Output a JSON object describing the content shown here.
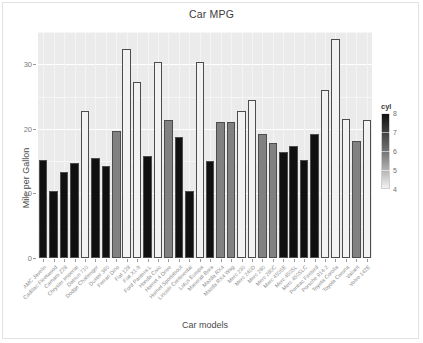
{
  "figure": {
    "title": "Car MPG",
    "legend_title": "cyl"
  },
  "axes": {
    "xlabel": "Car models",
    "ylabel": "Mile per Gallon",
    "y_ticks": [
      "0",
      "10",
      "20",
      "30"
    ],
    "legend_keys": [
      "8",
      "7",
      "6",
      "5",
      "4"
    ]
  },
  "chart_data": {
    "type": "bar",
    "title": "Car MPG",
    "xlabel": "Car models",
    "ylabel": "Mile per Gallon",
    "ylim": [
      0,
      35
    ],
    "ytick_values": [
      0,
      10,
      20,
      30
    ],
    "grid": true,
    "legend": {
      "title": "cyl",
      "position": "right",
      "type": "continuous-colorbar",
      "ticks": [
        8,
        7,
        6,
        5,
        4
      ],
      "low_color": "#f2f2f2",
      "high_color": "#111111"
    },
    "categories": [
      "AMC Javelin",
      "Cadillac Fleetwood",
      "Camaro Z28",
      "Chrysler Imperial",
      "Datsun 710",
      "Dodge Challenger",
      "Duster 360",
      "Ferrari Dino",
      "Fiat 128",
      "Fiat X1-9",
      "Ford Pantera L",
      "Honda Civic",
      "Hornet 4 Drive",
      "Hornet Sportabout",
      "Lincoln Continental",
      "Lotus Europa",
      "Maserati Bora",
      "Mazda RX4",
      "Mazda RX4 Wag",
      "Merc 230",
      "Merc 240D",
      "Merc 280",
      "Merc 280C",
      "Merc 450SE",
      "Merc 450SL",
      "Merc 450SLC",
      "Pontiac Firebird",
      "Porsche 914-2",
      "Toyota Corolla",
      "Toyota Corona",
      "Valiant",
      "Volvo 142E"
    ],
    "values": [
      15.2,
      10.4,
      13.3,
      14.7,
      22.8,
      15.5,
      14.3,
      19.7,
      32.4,
      27.3,
      15.8,
      30.4,
      21.4,
      18.7,
      10.4,
      30.4,
      15.0,
      21.0,
      21.0,
      22.8,
      24.4,
      19.2,
      17.8,
      16.4,
      17.3,
      15.2,
      19.2,
      26.0,
      33.9,
      21.5,
      18.1,
      21.4
    ],
    "color_values": [
      8,
      8,
      8,
      8,
      4,
      8,
      8,
      6,
      4,
      4,
      8,
      4,
      6,
      8,
      8,
      4,
      8,
      6,
      6,
      4,
      4,
      6,
      6,
      8,
      8,
      8,
      8,
      4,
      4,
      4,
      6,
      4
    ],
    "ylabel_unit": "Mile per Gallon"
  }
}
